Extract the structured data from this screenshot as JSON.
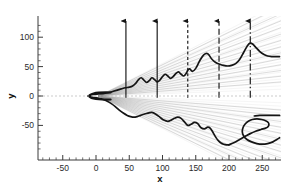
{
  "figure": {
    "kind": "scientific-flow-visualization",
    "background_color": "#ffffff",
    "contour_color": "#151515",
    "ray_color": "#9a9a9a",
    "axis_color": "#3a3a3a",
    "centerline_color": "#b5b5b5"
  },
  "axes": {
    "x": {
      "label": "x",
      "tick_labels": [
        "-50",
        "0",
        "50",
        "100",
        "150",
        "200",
        "250"
      ],
      "tick_values": [
        -50,
        0,
        50,
        100,
        150,
        200,
        250
      ],
      "minor_per_major": 5,
      "range": [
        -85,
        280
      ]
    },
    "y": {
      "label": "y",
      "tick_labels": [
        "-50",
        "0",
        "50",
        "100"
      ],
      "tick_values": [
        -50,
        0,
        50,
        100
      ],
      "minor_per_major": 5,
      "range": [
        -95,
        125
      ]
    }
  },
  "stations": [
    {
      "name": "station-1",
      "x": 45,
      "style": "solid",
      "arrow": "up"
    },
    {
      "name": "station-2",
      "x": 92,
      "style": "solid",
      "arrow": "up"
    },
    {
      "name": "station-3",
      "x": 138,
      "style": "dashed",
      "arrow": "up"
    },
    {
      "name": "station-4",
      "x": 185,
      "style": "longdash",
      "arrow": "up"
    },
    {
      "name": "station-5",
      "x": 232,
      "style": "dashdot",
      "arrow": "up"
    }
  ],
  "chart_data": {
    "type": "line",
    "title": "",
    "xlabel": "x",
    "ylabel": "y",
    "xlim": [
      -85,
      280
    ],
    "ylim": [
      -95,
      125
    ],
    "grid": false,
    "legend": "none",
    "series": [
      {
        "name": "upper-shear-layer",
        "color": "#151515",
        "x": [
          -12,
          -8,
          -4,
          0,
          4,
          9,
          14,
          20,
          26,
          32,
          38,
          44,
          50,
          55,
          60,
          64,
          68,
          72,
          76,
          80,
          84,
          88,
          92,
          96,
          100,
          104,
          108,
          112,
          116,
          120,
          124,
          128,
          132,
          136,
          138,
          141,
          145,
          150,
          156,
          162,
          168,
          174,
          180,
          186,
          192,
          198,
          204,
          210,
          216,
          222,
          228,
          232,
          236,
          240,
          246,
          252,
          258,
          264,
          270,
          276
        ],
        "y": [
          0,
          1.5,
          2.5,
          3,
          3.5,
          4,
          5,
          6,
          8,
          10,
          12,
          14,
          15,
          17,
          22,
          28,
          31,
          27,
          23,
          26,
          31,
          28,
          24,
          27,
          33,
          37,
          34,
          30,
          33,
          38,
          41,
          37,
          34,
          39,
          44,
          46,
          42,
          47,
          60,
          70,
          72,
          63,
          57,
          54,
          52,
          51,
          52,
          55,
          62,
          74,
          86,
          90,
          88,
          83,
          76,
          71,
          68,
          67,
          67,
          67
        ]
      },
      {
        "name": "lower-shear-layer",
        "color": "#151515",
        "x": [
          -12,
          -8,
          -4,
          0,
          5,
          11,
          17,
          23,
          29,
          35,
          41,
          47,
          52,
          57,
          62,
          67,
          72,
          78,
          84,
          90,
          96,
          102,
          108,
          113,
          118,
          123,
          128,
          133,
          138,
          143,
          148,
          153,
          158,
          163,
          168,
          172,
          176,
          180,
          184,
          188,
          192,
          196,
          200
        ],
        "y": [
          0,
          -1.5,
          -2.5,
          -3,
          -4,
          -6,
          -9,
          -13,
          -18,
          -24,
          -29,
          -33,
          -35,
          -36,
          -35,
          -33,
          -31,
          -29,
          -28,
          -31,
          -36,
          -41,
          -43,
          -41,
          -38,
          -36,
          -38,
          -44,
          -50,
          -48,
          -45,
          -47,
          -54,
          -56,
          -53,
          -55,
          -62,
          -70,
          -76,
          -80,
          -82,
          -83,
          -83
        ]
      },
      {
        "name": "lower-hook-outer",
        "color": "#151515",
        "x": [
          200,
          208,
          216,
          224,
          232,
          240,
          248,
          254,
          258,
          260,
          259,
          255,
          249,
          242,
          235,
          229,
          224,
          221,
          220,
          222,
          227,
          234,
          242,
          250,
          258,
          266,
          272,
          276
        ],
        "y": [
          -83,
          -79,
          -74,
          -69,
          -64,
          -60,
          -57,
          -55,
          -53,
          -49,
          -45,
          -42,
          -40,
          -39,
          -40,
          -43,
          -48,
          -54,
          -61,
          -68,
          -74,
          -78,
          -81,
          -82,
          -81,
          -78,
          -74,
          -71
        ]
      },
      {
        "name": "lower-wake-tail",
        "color": "#151515",
        "x": [
          238,
          246,
          254,
          262,
          270,
          276
        ],
        "y": [
          -34,
          -33,
          -33,
          -33,
          -33,
          -33
        ]
      }
    ],
    "ray_fan": {
      "name": "mach-wave-rays",
      "color": "#9a9a9a",
      "origin": [
        4,
        0
      ],
      "upper_slopes_deg": [
        5,
        7,
        9,
        11,
        13,
        15,
        17,
        19,
        21,
        23,
        25,
        27,
        29
      ],
      "lower_slopes_deg": [
        -5,
        -7,
        -9,
        -11,
        -13,
        -15,
        -17,
        -19,
        -21,
        -23,
        -25,
        -27,
        -29
      ]
    },
    "body": {
      "name": "blunt-body-outline",
      "color": "#151515",
      "nose_x": -10,
      "base_x": 22,
      "half_height": 6
    }
  }
}
